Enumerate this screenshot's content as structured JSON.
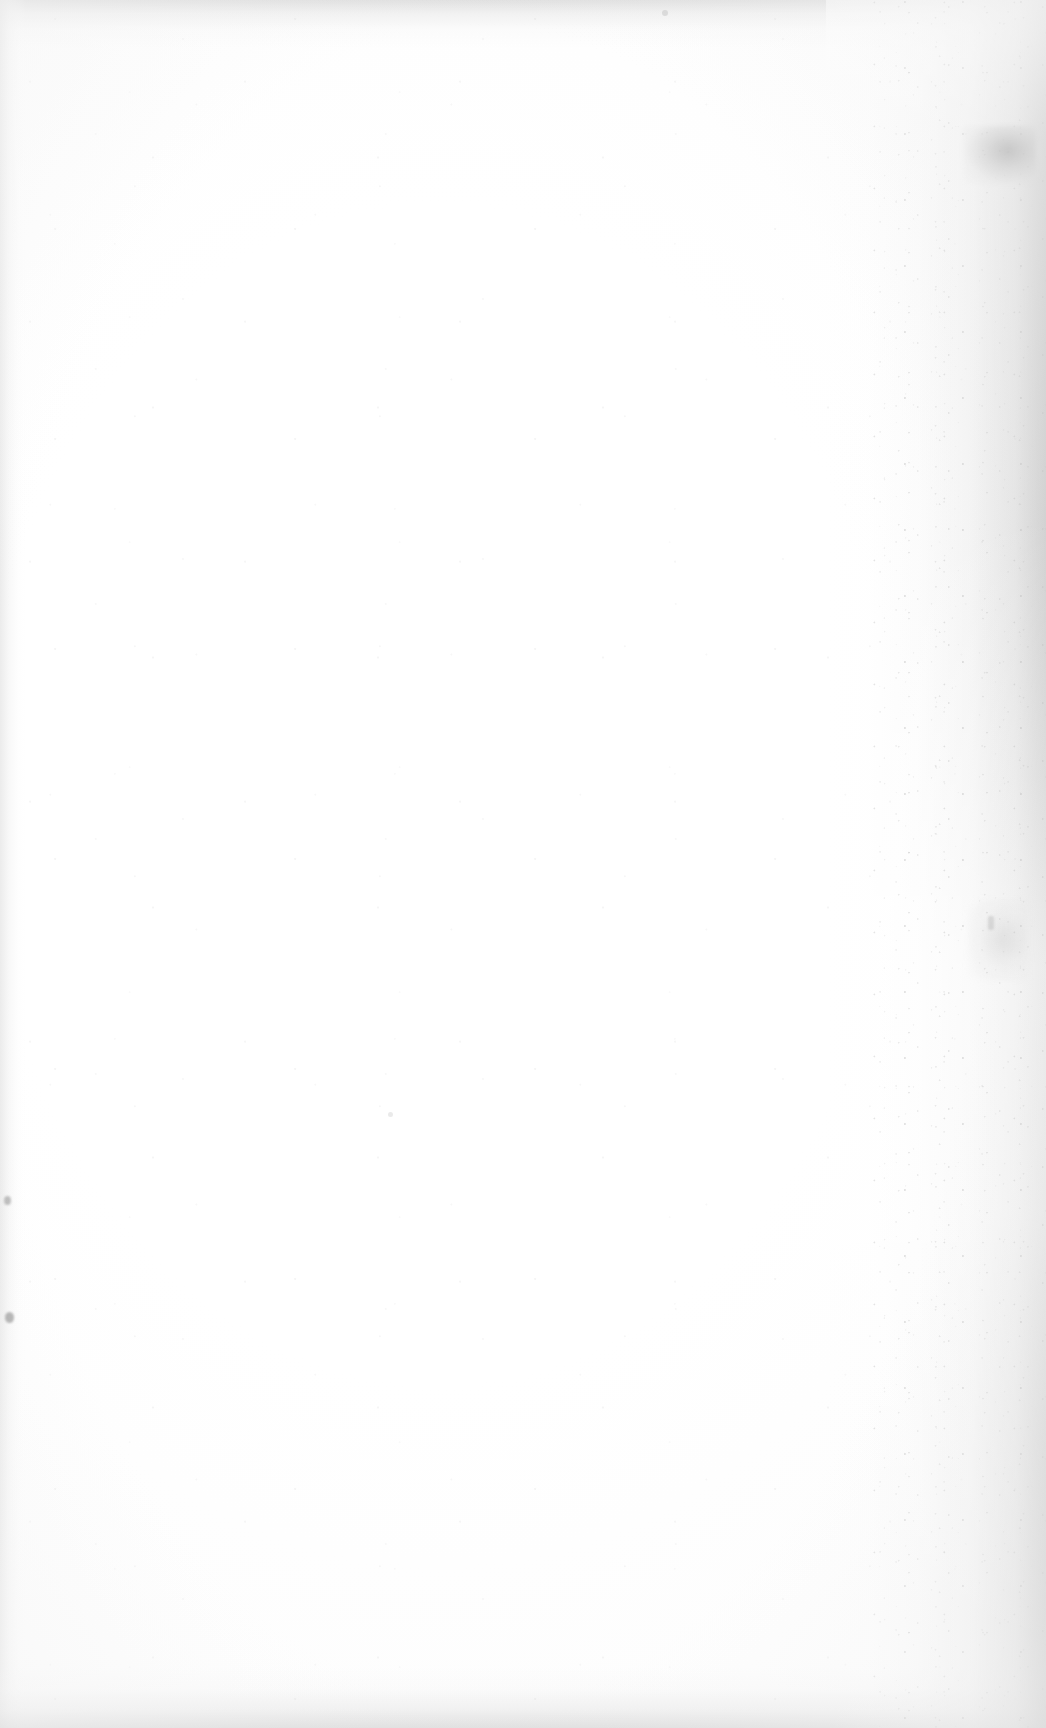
{
  "page": {
    "kind": "scanned-document-page",
    "state": "blank",
    "paper_color": "#ffffff",
    "width_px": 1046,
    "height_px": 1728
  },
  "content": {
    "text": "",
    "heading": "",
    "body": "",
    "page_number": "",
    "caption": "",
    "footnote": ""
  },
  "scan_artifacts": {
    "right_gutter_shadow": {
      "name": "right-edge-gutter-shadow",
      "color": "#bababa",
      "strongest_color": "#787878"
    },
    "left_edge_band": {
      "name": "left-edge-shadow",
      "color": "#e6e6e6"
    },
    "top_edge_band": {
      "name": "top-edge-shadow",
      "color": "#cdcdcd"
    },
    "bottom_edge_band": {
      "name": "bottom-edge-shadow",
      "color": "#cbcbcb"
    },
    "grain": {
      "name": "gutter-speckle-grain",
      "color": "#9a9a9a"
    },
    "specks": [
      {
        "name": "dust-speck-left-middle",
        "color": "#828282"
      },
      {
        "name": "dust-speck-left-lower",
        "color": "#737373"
      },
      {
        "name": "dust-speck-top-right",
        "color": "#c3c3c3"
      },
      {
        "name": "dust-speck-right-middle",
        "color": "#b9b9b9"
      },
      {
        "name": "dust-speck-center-lower",
        "color": "#d6d6d6"
      }
    ]
  }
}
